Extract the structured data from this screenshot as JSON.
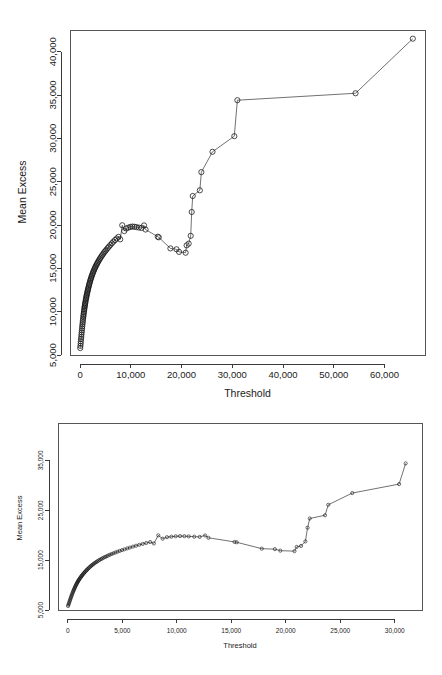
{
  "figure": {
    "panels": [
      {
        "name": "mean-excess-full-range",
        "xlabel": "Threshold",
        "ylabel": "Mean Excess"
      },
      {
        "name": "mean-excess-zoomed",
        "xlabel": "Threshold",
        "ylabel": "Mean Excess"
      }
    ]
  },
  "chart_data": [
    {
      "type": "line",
      "title": "",
      "subtitle": "",
      "xlabel": "Threshold",
      "ylabel": "Mean Excess",
      "xlim": [
        -2000,
        68000
      ],
      "ylim": [
        5000,
        42500
      ],
      "xticks": [
        0,
        10000,
        20000,
        30000,
        40000,
        50000,
        60000
      ],
      "xtick_labels": [
        "0",
        "10,000",
        "20,000",
        "30,000",
        "40,000",
        "50,000",
        "60,000"
      ],
      "yticks": [
        5000,
        10000,
        15000,
        20000,
        25000,
        30000,
        35000,
        40000
      ],
      "ytick_labels": [
        "5,000",
        "10,000",
        "15,000",
        "20,000",
        "25,000",
        "30,000",
        "35,000",
        "40,000"
      ],
      "grid": false,
      "legend": false,
      "marker": "open-circle",
      "series": [
        {
          "name": "mean excess",
          "x": [
            20,
            60,
            100,
            140,
            180,
            220,
            260,
            300,
            340,
            380,
            420,
            460,
            500,
            540,
            580,
            620,
            660,
            700,
            740,
            780,
            820,
            860,
            900,
            940,
            980,
            1020,
            1070,
            1120,
            1170,
            1220,
            1270,
            1320,
            1380,
            1440,
            1500,
            1560,
            1620,
            1690,
            1760,
            1830,
            1900,
            1980,
            2060,
            2140,
            2220,
            2310,
            2400,
            2500,
            2600,
            2700,
            2810,
            2920,
            3040,
            3160,
            3290,
            3420,
            3560,
            3700,
            3860,
            4020,
            4190,
            4370,
            4560,
            4760,
            4980,
            5200,
            5450,
            5700,
            5980,
            6260,
            6560,
            6880,
            7200,
            7560,
            7900,
            8300,
            8700,
            9100,
            9500,
            9900,
            10300,
            10700,
            11100,
            11600,
            12100,
            12600,
            12900,
            15300,
            15500,
            17800,
            19000,
            19500,
            20800,
            21000,
            21400,
            21800,
            22000,
            22200,
            23600,
            23900,
            26100,
            30400,
            31000,
            54300,
            65600
          ],
          "y": [
            5800,
            6050,
            6320,
            6580,
            6850,
            7100,
            7350,
            7600,
            7840,
            8080,
            8310,
            8540,
            8760,
            8970,
            9180,
            9380,
            9570,
            9760,
            9940,
            10120,
            10290,
            10450,
            10610,
            10760,
            10910,
            11050,
            11220,
            11380,
            11540,
            11690,
            11830,
            11970,
            12140,
            12300,
            12450,
            12600,
            12740,
            12910,
            13070,
            13220,
            13370,
            13540,
            13700,
            13850,
            13990,
            14150,
            14300,
            14460,
            14610,
            14750,
            14900,
            15050,
            15200,
            15340,
            15490,
            15630,
            15780,
            15920,
            16080,
            16230,
            16380,
            16530,
            16690,
            16850,
            17010,
            17170,
            17350,
            17520,
            17710,
            17890,
            18080,
            18260,
            18440,
            18630,
            18350,
            19970,
            19300,
            19600,
            19700,
            19780,
            19820,
            19800,
            19760,
            19700,
            19660,
            19950,
            19480,
            18650,
            18580,
            17300,
            17200,
            16900,
            16800,
            17650,
            17850,
            18750,
            21500,
            23350,
            24000,
            26100,
            28450,
            30250,
            34400,
            35200,
            41500,
            22300,
            14900
          ]
        }
      ]
    },
    {
      "type": "line",
      "title": "",
      "subtitle": "",
      "xlabel": "Threshold",
      "ylabel": "Mean Excess",
      "xlim": [
        -900,
        32500
      ],
      "ylim": [
        5000,
        42500
      ],
      "xticks": [
        0,
        5000,
        10000,
        15000,
        20000,
        25000,
        30000
      ],
      "xtick_labels": [
        "0",
        "5,000",
        "10,000",
        "15,000",
        "20,000",
        "25,000",
        "30,000"
      ],
      "yticks": [
        5000,
        15000,
        25000,
        35000
      ],
      "ytick_labels": [
        "5,000",
        "15,000",
        "25,000",
        "35,000"
      ],
      "grid": false,
      "legend": false,
      "marker": "open-circle",
      "series": [
        {
          "name": "mean excess",
          "x": [
            20,
            60,
            100,
            140,
            180,
            220,
            260,
            300,
            340,
            380,
            420,
            460,
            500,
            540,
            580,
            620,
            660,
            700,
            740,
            780,
            820,
            860,
            900,
            940,
            980,
            1020,
            1070,
            1120,
            1170,
            1220,
            1270,
            1320,
            1380,
            1440,
            1500,
            1560,
            1620,
            1690,
            1760,
            1830,
            1900,
            1980,
            2060,
            2140,
            2220,
            2310,
            2400,
            2500,
            2600,
            2700,
            2810,
            2920,
            3040,
            3160,
            3290,
            3420,
            3560,
            3700,
            3860,
            4020,
            4190,
            4370,
            4560,
            4760,
            4980,
            5200,
            5450,
            5700,
            5980,
            6260,
            6560,
            6880,
            7200,
            7560,
            7900,
            8300,
            8700,
            9100,
            9500,
            9900,
            10300,
            10700,
            11100,
            11600,
            12100,
            12600,
            12900,
            15300,
            15500,
            17800,
            19000,
            19500,
            20800,
            21000,
            21400,
            21800,
            22000,
            22200,
            23600,
            23900,
            26100,
            30400,
            31000
          ],
          "y": [
            5800,
            6050,
            6320,
            6580,
            6850,
            7100,
            7350,
            7600,
            7840,
            8080,
            8310,
            8540,
            8760,
            8970,
            9180,
            9380,
            9570,
            9760,
            9940,
            10120,
            10290,
            10450,
            10610,
            10760,
            10910,
            11050,
            11220,
            11380,
            11540,
            11690,
            11830,
            11970,
            12140,
            12300,
            12450,
            12600,
            12740,
            12910,
            13070,
            13220,
            13370,
            13540,
            13700,
            13850,
            13990,
            14150,
            14300,
            14460,
            14610,
            14750,
            14900,
            15050,
            15200,
            15340,
            15490,
            15630,
            15780,
            15920,
            16080,
            16230,
            16380,
            16530,
            16690,
            16850,
            17010,
            17170,
            17350,
            17520,
            17710,
            17890,
            18080,
            18260,
            18440,
            18630,
            18350,
            19970,
            19300,
            19600,
            19700,
            19780,
            19820,
            19800,
            19760,
            19700,
            19660,
            19950,
            19480,
            18650,
            18580,
            17300,
            17200,
            16900,
            16800,
            17650,
            17850,
            18750,
            21500,
            23350,
            24000,
            26100,
            28450,
            30250,
            34400,
            35200,
            41500
          ]
        }
      ]
    }
  ]
}
